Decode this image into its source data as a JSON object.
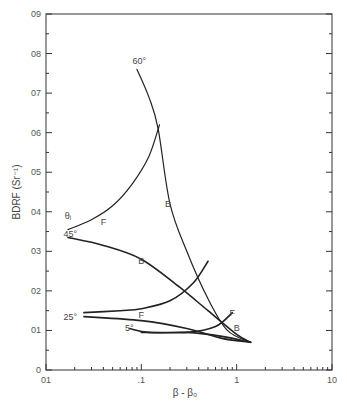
{
  "chart_data": {
    "type": "line",
    "title": "",
    "xlabel": "β - β₀",
    "ylabel": "BDRF (Sr⁻¹)",
    "xscale": "log",
    "xlim": [
      0.01,
      10
    ],
    "ylim": [
      0,
      0.09
    ],
    "x_tick_labels": [
      "01",
      ".1",
      "1",
      "10"
    ],
    "x_ticks": [
      0.01,
      0.1,
      1,
      10
    ],
    "y_tick_labels": [
      "0",
      "01",
      "02",
      "03",
      "04",
      "05",
      "06",
      "07",
      "08",
      "09"
    ],
    "y_ticks": [
      0,
      0.01,
      0.02,
      0.03,
      0.04,
      0.05,
      0.06,
      0.07,
      0.08,
      0.09
    ],
    "grid": false,
    "legend": "none (inline curve labels)",
    "annotations": [
      {
        "text": "θᵢ",
        "x": 0.017,
        "y": 0.039
      },
      {
        "text": "60°",
        "x": 0.095,
        "y": 0.078
      },
      {
        "text": "45°",
        "x": 0.018,
        "y": 0.0345
      },
      {
        "text": "25°",
        "x": 0.018,
        "y": 0.0135
      },
      {
        "text": "5°",
        "x": 0.075,
        "y": 0.0105
      },
      {
        "text": "F",
        "x": 0.04,
        "y": 0.0375
      },
      {
        "text": "B",
        "x": 0.19,
        "y": 0.042
      },
      {
        "text": "B",
        "x": 0.1,
        "y": 0.0275
      },
      {
        "text": "F",
        "x": 0.1,
        "y": 0.014
      },
      {
        "text": "F",
        "x": 0.9,
        "y": 0.0145
      },
      {
        "text": "B",
        "x": 1.0,
        "y": 0.0105
      }
    ],
    "series": [
      {
        "name": "60° backward (B)",
        "x": [
          0.09,
          0.12,
          0.15,
          0.2,
          0.3,
          0.5,
          0.8,
          1.4
        ],
        "y": [
          0.076,
          0.069,
          0.061,
          0.042,
          0.03,
          0.018,
          0.01,
          0.007
        ]
      },
      {
        "name": "60° forward (F)",
        "x": [
          0.017,
          0.03,
          0.05,
          0.08,
          0.12,
          0.155
        ],
        "y": [
          0.0355,
          0.038,
          0.0415,
          0.047,
          0.054,
          0.062
        ]
      },
      {
        "name": "45° backward (B)",
        "x": [
          0.017,
          0.04,
          0.1,
          0.25,
          0.5,
          1.0,
          1.4
        ],
        "y": [
          0.0335,
          0.0315,
          0.028,
          0.021,
          0.015,
          0.009,
          0.007
        ]
      },
      {
        "name": "45° forward (F)",
        "x": [
          0.025,
          0.06,
          0.1,
          0.2,
          0.35,
          0.5
        ],
        "y": [
          0.0145,
          0.015,
          0.0155,
          0.0175,
          0.022,
          0.0275
        ]
      },
      {
        "name": "25° backward (B)",
        "x": [
          0.025,
          0.1,
          0.3,
          0.7,
          1.4
        ],
        "y": [
          0.0135,
          0.0125,
          0.0105,
          0.008,
          0.007
        ]
      },
      {
        "name": "25° forward (F)",
        "x": [
          0.1,
          0.3,
          0.6,
          0.9
        ],
        "y": [
          0.0095,
          0.0095,
          0.011,
          0.0145
        ]
      },
      {
        "name": "5°",
        "x": [
          0.075,
          0.12,
          0.3,
          0.7,
          1.4
        ],
        "y": [
          0.0105,
          0.0095,
          0.0095,
          0.0085,
          0.007
        ]
      }
    ]
  }
}
